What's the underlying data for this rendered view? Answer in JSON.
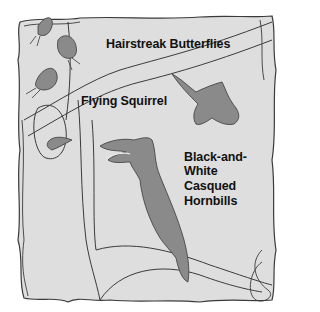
{
  "figure": {
    "type": "illustration",
    "style": "grayscale line drawing of a tree canopy scene",
    "colors": {
      "background": "#ffffff",
      "panel_fill": "#dedede",
      "animal_fill": "#8a8a8a",
      "outline": "#3a3a3a",
      "text": "#111111"
    }
  },
  "labels": {
    "butterflies": "Hairstreak Butterflies",
    "squirrel": "Flying Squirrel",
    "hornbill_line1": "Black-and-",
    "hornbill_line2": "White",
    "hornbill_line3": "Casqued",
    "hornbill_line4": "Hornbills"
  }
}
